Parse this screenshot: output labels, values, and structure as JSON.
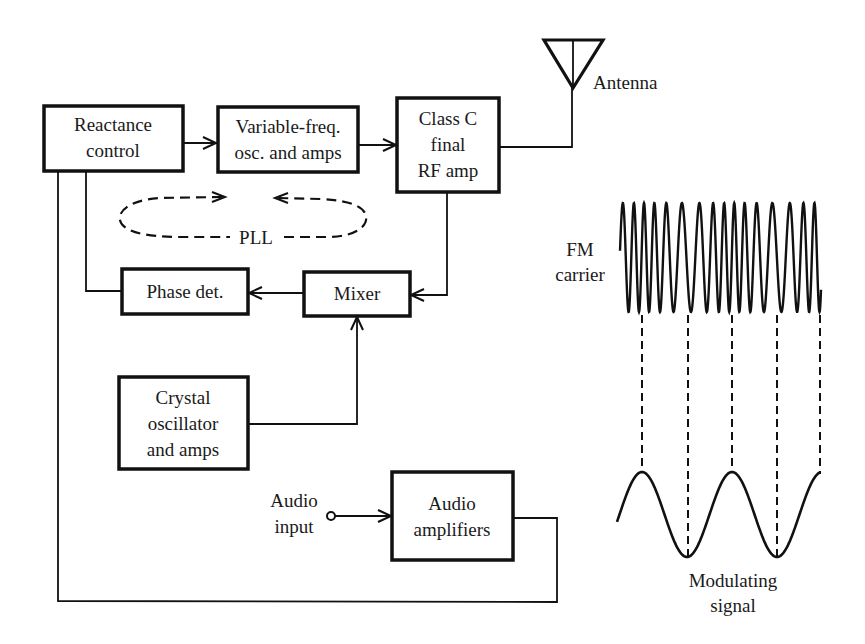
{
  "blocks": {
    "reactance": [
      "Reactance",
      "control"
    ],
    "vfo": [
      "Variable-freq.",
      "osc. and amps"
    ],
    "classc": [
      "Class C",
      "final",
      "RF amp"
    ],
    "phase": [
      "Phase det."
    ],
    "mixer": [
      "Mixer"
    ],
    "crystal": [
      "Crystal",
      "oscillator",
      "and amps"
    ],
    "audioamp": [
      "Audio",
      "amplifiers"
    ]
  },
  "labels": {
    "antenna": "Antenna",
    "pll": "PLL",
    "audio_input": [
      "Audio",
      "input"
    ],
    "fm_carrier": [
      "FM",
      "carrier"
    ],
    "modulating_signal": [
      "Modulating",
      "signal"
    ]
  },
  "waveforms": {
    "modulating_cycles": 2.25,
    "carrier_description": "frequency-modulated carrier; densest at modulating-signal peaks"
  }
}
